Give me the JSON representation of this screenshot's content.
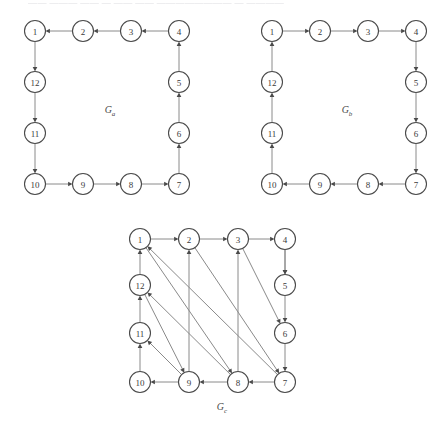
{
  "page": {
    "top_cut_text": "—— ——— ——  — —— ——  ———————— —  ————",
    "background_color": "#ffffff",
    "node_fill": "#ffffff",
    "node_stroke": "#4a4a4a",
    "edge_color": "#8a8a8a",
    "label_color": "#3a3a3a"
  },
  "figures": [
    {
      "id": "Ga",
      "caption_main": "G",
      "caption_sub": "a",
      "caption_x": 104,
      "caption_y": 101,
      "origin_x": 6,
      "origin_y": 12,
      "nodes": [
        {
          "id": "1",
          "label": "1",
          "x": 29,
          "y": 19
        },
        {
          "id": "2",
          "label": "2",
          "x": 77,
          "y": 19
        },
        {
          "id": "3",
          "label": "3",
          "x": 125,
          "y": 19
        },
        {
          "id": "4",
          "label": "4",
          "x": 173,
          "y": 19
        },
        {
          "id": "5",
          "label": "5",
          "x": 173,
          "y": 70
        },
        {
          "id": "6",
          "label": "6",
          "x": 173,
          "y": 121
        },
        {
          "id": "7",
          "label": "7",
          "x": 173,
          "y": 172
        },
        {
          "id": "8",
          "label": "8",
          "x": 125,
          "y": 172
        },
        {
          "id": "9",
          "label": "9",
          "x": 77,
          "y": 172
        },
        {
          "id": "10",
          "label": "10",
          "x": 29,
          "y": 172
        },
        {
          "id": "11",
          "label": "11",
          "x": 29,
          "y": 121
        },
        {
          "id": "12",
          "label": "12",
          "x": 29,
          "y": 70
        }
      ],
      "edges": [
        {
          "from": "2",
          "to": "1"
        },
        {
          "from": "3",
          "to": "2"
        },
        {
          "from": "4",
          "to": "3"
        },
        {
          "from": "1",
          "to": "12"
        },
        {
          "from": "12",
          "to": "11"
        },
        {
          "from": "11",
          "to": "10"
        },
        {
          "from": "10",
          "to": "9"
        },
        {
          "from": "9",
          "to": "8"
        },
        {
          "from": "8",
          "to": "7"
        },
        {
          "from": "7",
          "to": "6"
        },
        {
          "from": "6",
          "to": "5"
        },
        {
          "from": "5",
          "to": "4"
        }
      ]
    },
    {
      "id": "Gb",
      "caption_main": "G",
      "caption_sub": "b",
      "caption_x": 104,
      "caption_y": 101,
      "origin_x": 243,
      "origin_y": 12,
      "nodes": [
        {
          "id": "1",
          "label": "1",
          "x": 29,
          "y": 19
        },
        {
          "id": "2",
          "label": "2",
          "x": 77,
          "y": 19
        },
        {
          "id": "3",
          "label": "3",
          "x": 125,
          "y": 19
        },
        {
          "id": "4",
          "label": "4",
          "x": 173,
          "y": 19
        },
        {
          "id": "5",
          "label": "5",
          "x": 173,
          "y": 70
        },
        {
          "id": "6",
          "label": "6",
          "x": 173,
          "y": 121
        },
        {
          "id": "7",
          "label": "7",
          "x": 173,
          "y": 172
        },
        {
          "id": "8",
          "label": "8",
          "x": 125,
          "y": 172
        },
        {
          "id": "9",
          "label": "9",
          "x": 77,
          "y": 172
        },
        {
          "id": "10",
          "label": "10",
          "x": 29,
          "y": 172
        },
        {
          "id": "11",
          "label": "11",
          "x": 29,
          "y": 121
        },
        {
          "id": "12",
          "label": "12",
          "x": 29,
          "y": 70
        }
      ],
      "edges": [
        {
          "from": "1",
          "to": "2"
        },
        {
          "from": "2",
          "to": "3"
        },
        {
          "from": "3",
          "to": "4"
        },
        {
          "from": "4",
          "to": "5"
        },
        {
          "from": "5",
          "to": "6"
        },
        {
          "from": "6",
          "to": "7"
        },
        {
          "from": "7",
          "to": "8"
        },
        {
          "from": "8",
          "to": "9"
        },
        {
          "from": "9",
          "to": "10"
        },
        {
          "from": "10",
          "to": "11"
        },
        {
          "from": "11",
          "to": "12"
        },
        {
          "from": "12",
          "to": "1"
        }
      ]
    },
    {
      "id": "Gc",
      "caption_main": "G",
      "caption_sub": "c",
      "caption_x": 104,
      "caption_y": 188,
      "origin_x": 118,
      "origin_y": 222,
      "nodes": [
        {
          "id": "1",
          "label": "1",
          "x": 22,
          "y": 17
        },
        {
          "id": "2",
          "label": "2",
          "x": 71,
          "y": 17
        },
        {
          "id": "3",
          "label": "3",
          "x": 120,
          "y": 17
        },
        {
          "id": "4",
          "label": "4",
          "x": 167,
          "y": 17
        },
        {
          "id": "5",
          "label": "5",
          "x": 167,
          "y": 63
        },
        {
          "id": "6",
          "label": "6",
          "x": 167,
          "y": 111
        },
        {
          "id": "7",
          "label": "7",
          "x": 167,
          "y": 160
        },
        {
          "id": "8",
          "label": "8",
          "x": 120,
          "y": 160
        },
        {
          "id": "9",
          "label": "9",
          "x": 71,
          "y": 160
        },
        {
          "id": "10",
          "label": "10",
          "x": 22,
          "y": 160
        },
        {
          "id": "11",
          "label": "11",
          "x": 22,
          "y": 111
        },
        {
          "id": "12",
          "label": "12",
          "x": 22,
          "y": 63
        }
      ],
      "edges": [
        {
          "from": "1",
          "to": "2"
        },
        {
          "from": "2",
          "to": "3"
        },
        {
          "from": "3",
          "to": "4"
        },
        {
          "from": "4",
          "to": "5"
        },
        {
          "from": "5",
          "to": "6"
        },
        {
          "from": "6",
          "to": "7"
        },
        {
          "from": "7",
          "to": "8"
        },
        {
          "from": "8",
          "to": "9"
        },
        {
          "from": "9",
          "to": "10"
        },
        {
          "from": "10",
          "to": "11"
        },
        {
          "from": "11",
          "to": "12"
        },
        {
          "from": "12",
          "to": "1"
        },
        {
          "from": "4",
          "to": "5",
          "chord": true
        },
        {
          "from": "3",
          "to": "6",
          "chord": true
        },
        {
          "from": "2",
          "to": "7",
          "chord": true
        },
        {
          "from": "1",
          "to": "8",
          "chord": true
        },
        {
          "from": "12",
          "to": "9",
          "chord": true
        },
        {
          "from": "9",
          "to": "2",
          "chord": true
        },
        {
          "from": "8",
          "to": "3",
          "chord": true
        },
        {
          "from": "7",
          "to": "1",
          "chord": true
        },
        {
          "from": "9",
          "to": "11",
          "chord": true
        },
        {
          "from": "8",
          "to": "12",
          "chord": true
        }
      ]
    }
  ]
}
